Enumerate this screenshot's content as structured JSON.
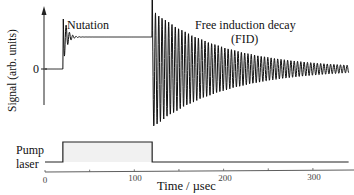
{
  "chart_data": {
    "type": "line",
    "title": "",
    "xlabel": "Time / µsec",
    "ylabel": "Signal (arb. units)",
    "xlim": [
      0,
      340
    ],
    "x_ticks": [
      0,
      100,
      200,
      300
    ],
    "y_ticks": [
      {
        "label": "0",
        "value": 0
      }
    ],
    "grid": false,
    "annotations": [
      "Nutation",
      "Free induction decay",
      "(FID)"
    ],
    "series": [
      {
        "name": "Signal",
        "description": "Zero before pump; at pump on (t≈20 µs) jumps to a steady level with damped nutation oscillations; at pump off (t≈120 µs) exhibits a large oscillating free induction decay around zero, decaying by ~t=300 µs",
        "steady_level": 0.5,
        "pump_on": 20,
        "pump_off": 120,
        "fid_peak_amplitude": 1.0,
        "fid_decay_time_us": 80
      },
      {
        "name": "Pump laser",
        "x": [
          0,
          20,
          20,
          120,
          120,
          340
        ],
        "values": [
          0,
          0,
          1,
          1,
          0,
          0
        ]
      }
    ]
  },
  "labels": {
    "ylabel": "Signal (arb. units)",
    "zero": "0",
    "nutation": "Nutation",
    "fid1": "Free induction decay",
    "fid2": "(FID)",
    "pump1": "Pump",
    "pump2": "laser",
    "xlabel": "Time / µsec",
    "ticks": [
      "0",
      "100",
      "200",
      "300"
    ]
  }
}
